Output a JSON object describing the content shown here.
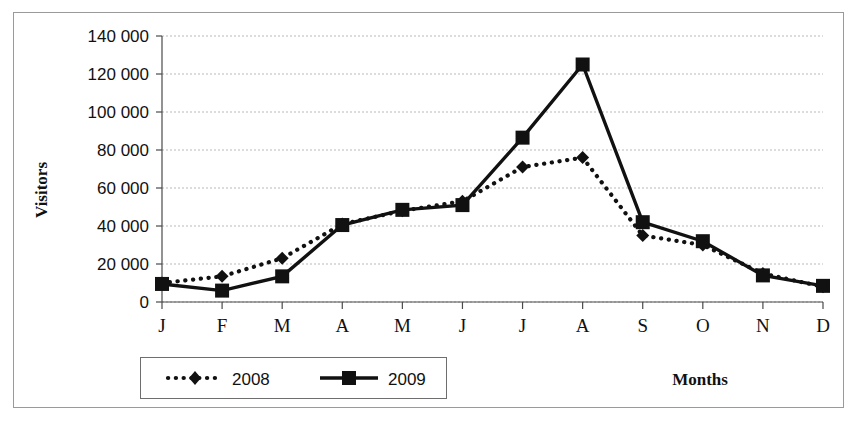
{
  "chart_data": {
    "type": "line",
    "title": "",
    "xlabel": "Months",
    "ylabel": "Visitors",
    "categories": [
      "J",
      "F",
      "M",
      "A",
      "M",
      "J",
      "J",
      "A",
      "S",
      "O",
      "N",
      "D"
    ],
    "ylim": [
      0,
      140000
    ],
    "ytick_values": [
      0,
      20000,
      40000,
      60000,
      80000,
      100000,
      120000,
      140000
    ],
    "ytick_labels": [
      "0",
      "20 000",
      "40 000",
      "60 000",
      "80 000",
      "100 000",
      "120 000",
      "140 000"
    ],
    "grid": true,
    "legend_position": "bottom-left",
    "series": [
      {
        "name": "2008",
        "style": "dotted",
        "marker": "diamond",
        "color": "#111111",
        "values": [
          10000,
          13500,
          23000,
          41000,
          48000,
          53000,
          71000,
          76000,
          35000,
          30000,
          15000,
          8000
        ]
      },
      {
        "name": "2009",
        "style": "solid",
        "marker": "square",
        "color": "#111111",
        "values": [
          9500,
          6000,
          13500,
          40500,
          48500,
          51000,
          86500,
          125000,
          42000,
          32000,
          14000,
          8500
        ]
      }
    ]
  },
  "axes": {
    "y_title": "Visitors",
    "x_title": "Months"
  },
  "legend": {
    "entries": [
      {
        "label": "2008"
      },
      {
        "label": "2009"
      }
    ]
  }
}
